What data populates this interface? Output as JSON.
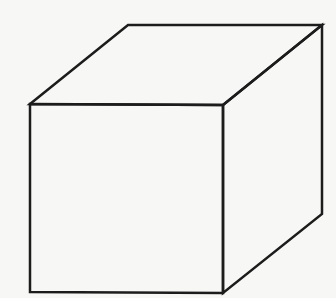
{
  "diagram": {
    "type": "cube-line-drawing",
    "background": "#f7f7f5",
    "stroke_color": "#1c1c1c",
    "stroke_width": 2.5,
    "faces": [
      {
        "name": "front-face",
        "points": "30,104 223,105 223,293 30,292"
      },
      {
        "name": "top-face",
        "points": "30,104 128,25 322,25 223,105"
      },
      {
        "name": "right-face",
        "points": "223,105 322,25 322,214 223,293"
      }
    ]
  }
}
